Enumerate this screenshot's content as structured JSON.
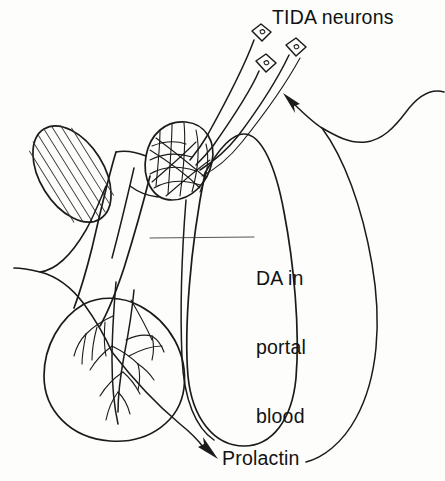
{
  "figure": {
    "background_color": "#fdfdfb",
    "ink_color": "#1b1b1b"
  },
  "labels": {
    "tida": "TIDA neurons",
    "da_portal_line1": "DA in",
    "da_portal_line2": "portal",
    "da_portal_line3": "blood",
    "prolactin": "Prolactin"
  },
  "structures": {
    "neuron_cell_bodies": 3,
    "mammillary_body": "hatched-oval",
    "median_eminence": "capillary-plexus-mesh",
    "pituitary_stalk": "infundibulum",
    "anterior_lobe": "vascular-tree",
    "posterior_lobe": "teardrop"
  },
  "arrows": {
    "feedback_to_neurons": "arrow-up-left",
    "prolactin_release": "arrow-right"
  }
}
